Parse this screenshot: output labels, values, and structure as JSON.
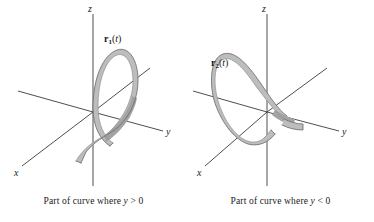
{
  "figure": {
    "type": "math-diagram",
    "panel_count": 2
  },
  "colors": {
    "axis": "#3a3a3a",
    "ribbon_fill": "#bdbdbd",
    "ribbon_fill_shadow": "#a3a3a3",
    "ribbon_edge": "#6e6e6e",
    "text": "#1a1a1a",
    "background": "#ffffff"
  },
  "panels": [
    {
      "id": "left",
      "axes": {
        "x_label": "x",
        "y_label": "y",
        "z_label": "z"
      },
      "curve": {
        "name": "r",
        "subscript": "1",
        "parameter": "t",
        "label_text": "r1(t)",
        "style": "shaded-ribbon-helix",
        "loop_direction": "opens toward positive y"
      },
      "caption": {
        "prefix": "Part of curve where ",
        "variable": "y",
        "relation": " > 0",
        "full": "Part of curve where y > 0"
      }
    },
    {
      "id": "right",
      "axes": {
        "x_label": "x",
        "y_label": "y",
        "z_label": "z"
      },
      "curve": {
        "name": "r",
        "subscript": "2",
        "parameter": "t",
        "label_text": "r2(t)",
        "style": "shaded-ribbon-helix",
        "loop_direction": "opens toward negative y"
      },
      "caption": {
        "prefix": "Part of curve where ",
        "variable": "y",
        "relation": " < 0",
        "full": "Part of curve where y < 0"
      }
    }
  ]
}
